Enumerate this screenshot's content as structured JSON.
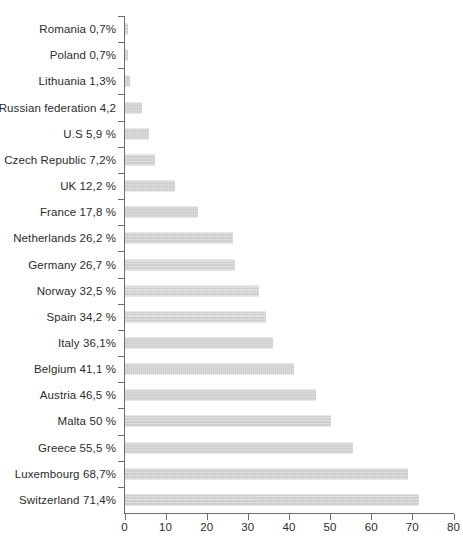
{
  "chart_data": {
    "type": "bar",
    "orientation": "horizontal",
    "title": "",
    "subtitle": "",
    "xlabel": "",
    "ylabel": "",
    "xlim": [
      0,
      80
    ],
    "xticks": [
      "0",
      "10",
      "20",
      "30",
      "40",
      "50",
      "60",
      "70",
      "80"
    ],
    "grid": false,
    "legend": null,
    "bar_color": "#d2d2d2",
    "axis_color": "#6d6d6d",
    "text_color": "#2b2b2b",
    "categories": [
      "Romania",
      "Poland",
      "Lithuania",
      "Russian federation",
      "U.S",
      "Czech Republic",
      "UK",
      "France",
      "Netherlands",
      "Germany",
      "Norway",
      "Spain",
      "Italy",
      "Belgium",
      "Austria",
      "Malta",
      "Greece",
      "Luxembourg",
      "Switzerland"
    ],
    "values": [
      0.7,
      0.7,
      1.3,
      4.2,
      5.9,
      7.2,
      12.2,
      17.8,
      26.2,
      26.7,
      32.5,
      34.2,
      36.1,
      41.1,
      46.5,
      50,
      55.5,
      68.7,
      71.4
    ],
    "tick_labels": [
      "Romania 0,7%",
      "Poland 0,7%",
      "Lithuania 1,3%",
      "Russian federation 4,2",
      "U.S 5,9 %",
      "Czech Republic 7,2%",
      "UK 12,2 %",
      "France 17,8 %",
      "Netherlands 26,2 %",
      "Germany 26,7 %",
      "Norway 32,5 %",
      "Spain 34,2 %",
      "Italy 36,1%",
      "Belgium 41,1 %",
      "Austria 46,5 %",
      "Malta 50 %",
      "Greece 55,5 %",
      "Luxembourg 68,7%",
      "Switzerland 71,4%"
    ]
  }
}
